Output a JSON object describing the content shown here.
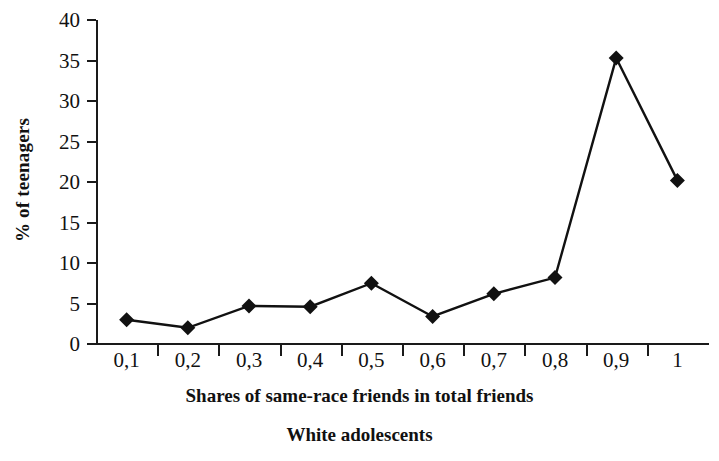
{
  "chart_data": {
    "type": "line",
    "title": "",
    "caption": "White adolescents",
    "xlabel": "Shares of same-race friends in total friends",
    "ylabel": "% of teenagers",
    "categories": [
      "0,1",
      "0,2",
      "0,3",
      "0,4",
      "0,5",
      "0,6",
      "0,7",
      "0,8",
      "0,9",
      "1"
    ],
    "values": [
      3.0,
      2.0,
      4.7,
      4.6,
      7.5,
      3.4,
      6.2,
      8.2,
      35.3,
      20.2
    ],
    "ylim": [
      0,
      40
    ],
    "ytick_labels": [
      "0",
      "5",
      "10",
      "15",
      "20",
      "25",
      "30",
      "35",
      "40"
    ],
    "ytick_values": [
      0,
      5,
      10,
      15,
      20,
      25,
      30,
      35,
      40
    ],
    "grid": false,
    "legend": "none",
    "series_color": "#111111",
    "marker": "diamond",
    "axis_color": "#1a1a1a"
  }
}
